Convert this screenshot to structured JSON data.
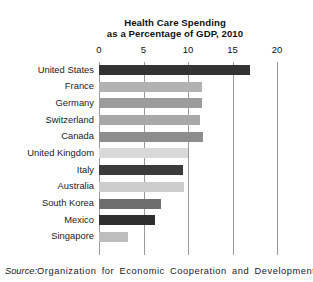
{
  "chart_data": {
    "type": "bar",
    "orientation": "horizontal",
    "title": "Health Care Spending as a Percentage of GDP, 2010",
    "title_lines": [
      "Health Care Spending",
      "as a Percentage of GDP, 2010"
    ],
    "xlabel": "",
    "ylabel": "",
    "xlim": [
      0,
      20
    ],
    "xticks": [
      0,
      5,
      10,
      15,
      20
    ],
    "xtick_labels": [
      "0",
      "5",
      "10",
      "15",
      "20"
    ],
    "grid": "vertical",
    "legend": "none",
    "categories": [
      "United States",
      "France",
      "Germany",
      "Switzerland",
      "Canada",
      "United Kingdom",
      "Italy",
      "Australia",
      "South Korea",
      "Mexico",
      "Singapore"
    ],
    "values": [
      17.0,
      11.6,
      11.6,
      11.4,
      11.7,
      10.0,
      9.4,
      9.5,
      7.0,
      6.3,
      3.3
    ],
    "bar_colors": [
      "#333333",
      "#b2b2b2",
      "#9c9c9c",
      "#a8a8a8",
      "#8d8d8d",
      "#d9d9d9",
      "#3b3b3b",
      "#cccccc",
      "#6e6e6e",
      "#2f2f2f",
      "#bdbdbd"
    ]
  },
  "source": {
    "prefix": "Source:",
    "text": "Organization for Economic Cooperation and Development,"
  },
  "colors": {
    "grid": "#9a9a9a",
    "text": "#1a1a1a",
    "background": "#ffffff"
  }
}
